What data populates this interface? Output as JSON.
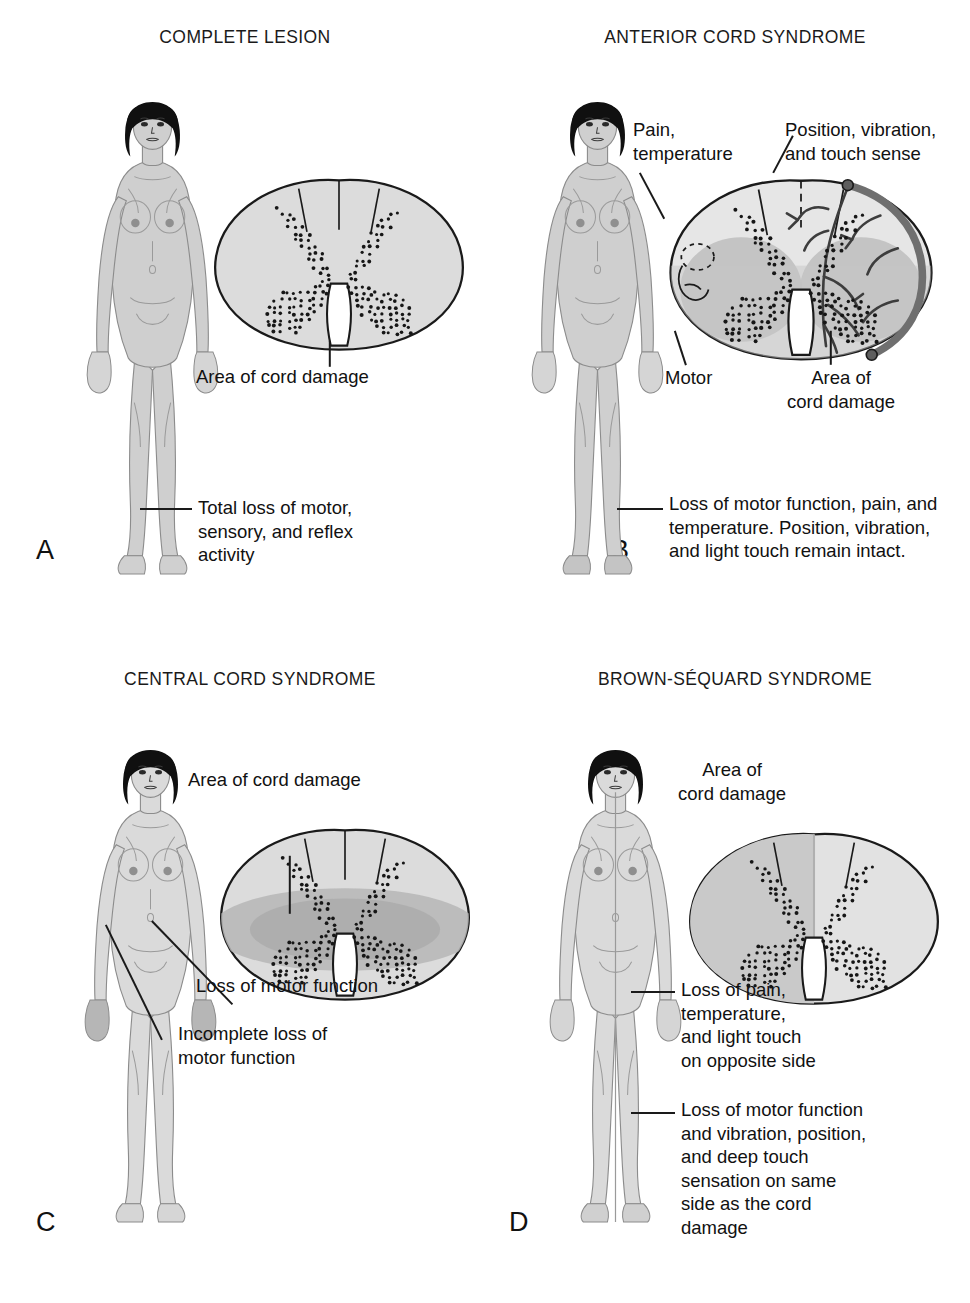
{
  "figure": {
    "colors": {
      "ink": "#1a1a1a",
      "cord_fill": "#d8d8d8",
      "cord_fill_light": "#e4e4e4",
      "grey_matter_shade": "#b9b9b9",
      "body_skin": "#cfcfcf",
      "body_shaded": "#a8a8a8",
      "hair": "#101010",
      "vessel": "#8a8a8a",
      "stipple": "#161616"
    }
  },
  "panels": [
    {
      "letter": "A",
      "title": "COMPLETE LESION",
      "title_lines": [
        "COMPLETE LESION"
      ],
      "cord": {
        "type": "complete",
        "shaded_region": "none",
        "stipple": "full-butterfly"
      },
      "annotations": [
        {
          "name": "area-of-cord-damage",
          "text": "Area of cord damage",
          "lines": [
            "Area of cord damage"
          ]
        },
        {
          "name": "deficit",
          "text": "Total loss of motor, sensory, and reflex activity",
          "lines": [
            "Total loss of motor,",
            "sensory, and reflex",
            "activity"
          ]
        }
      ]
    },
    {
      "letter": "B",
      "title": "ANTERIOR CORD SYNDROME",
      "title_lines": [
        "ANTERIOR CORD",
        "SYNDROME"
      ],
      "cord": {
        "type": "anterior",
        "shaded_region": "anterior-two-thirds",
        "stipple": "full-butterfly",
        "vessels": "anterior spinal artery with branching radicular vessels on right"
      },
      "annotations": [
        {
          "name": "pain-temperature",
          "text": "Pain, temperature",
          "lines": [
            "Pain,",
            "temperature"
          ]
        },
        {
          "name": "position-vibration-touch",
          "text": "Position, vibration, and touch sense",
          "lines": [
            "Position, vibration,",
            "and touch sense"
          ]
        },
        {
          "name": "motor",
          "text": "Motor",
          "lines": [
            "Motor"
          ]
        },
        {
          "name": "area-of-cord-damage",
          "text": "Area of cord damage",
          "lines": [
            "Area of",
            "cord damage"
          ]
        },
        {
          "name": "deficit",
          "text": "Loss of motor function, pain, and temperature. Position, vibration, and light touch remain intact.",
          "lines": [
            "Loss of motor function, pain, and",
            "temperature.  Position, vibration,",
            "and light touch remain intact."
          ]
        }
      ]
    },
    {
      "letter": "C",
      "title": "CENTRAL CORD SYNDROME",
      "title_lines": [
        "CENTRAL CORD",
        "SYNDROME"
      ],
      "cord": {
        "type": "central",
        "shaded_region": "central-horizontal-band",
        "stipple": "full-butterfly"
      },
      "annotations": [
        {
          "name": "area-of-cord-damage",
          "text": "Area of cord damage",
          "lines": [
            "Area of cord damage"
          ]
        },
        {
          "name": "loss-of-motor-function",
          "text": "Loss of motor function",
          "lines": [
            "Loss of motor function"
          ]
        },
        {
          "name": "incomplete-loss",
          "text": "Incomplete loss of motor function",
          "lines": [
            "Incomplete loss of",
            "motor function"
          ]
        }
      ]
    },
    {
      "letter": "D",
      "title": "BROWN-SÉQUARD SYNDROME",
      "title_lines": [
        "BROWN-SÉQUARD",
        "SYNDROME"
      ],
      "cord": {
        "type": "hemisection",
        "shaded_region": "left-half",
        "stipple": "full-butterfly"
      },
      "annotations": [
        {
          "name": "area-of-cord-damage",
          "text": "Area of cord damage",
          "lines": [
            "Area of",
            "cord damage"
          ]
        },
        {
          "name": "contralateral-deficit",
          "text": "Loss of pain, temperature, and light touch on opposite side",
          "lines": [
            "Loss of pain,",
            "temperature,",
            "and light touch",
            "on opposite side"
          ]
        },
        {
          "name": "ipsilateral-deficit",
          "text": "Loss of motor function and vibration, position, and deep touch sensation on same side as the cord damage",
          "lines": [
            "Loss of motor function",
            "and vibration, position,",
            "and deep touch",
            "sensation on same",
            "side as the cord",
            "damage"
          ]
        }
      ]
    }
  ]
}
